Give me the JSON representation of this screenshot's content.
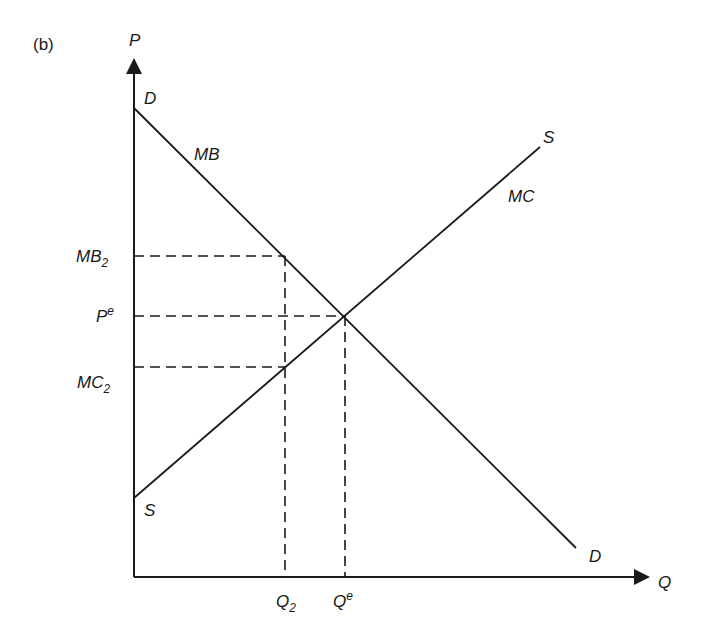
{
  "panel_label": "(b)",
  "axes": {
    "y_label": "P",
    "x_label": "Q"
  },
  "curves": {
    "demand": {
      "end_label_top": "D",
      "end_label_bottom": "D",
      "curve_label": "MB"
    },
    "supply": {
      "end_label_top": "S",
      "end_label_bottom": "S",
      "curve_label": "MC"
    }
  },
  "y_ticks": [
    {
      "base": "MB",
      "sub": "2"
    },
    {
      "base": "P",
      "sup": "e"
    },
    {
      "base": "MC",
      "sub": "2"
    }
  ],
  "x_ticks": [
    {
      "base": "Q",
      "sub": "2"
    },
    {
      "base": "Q",
      "sup": "e"
    }
  ],
  "colors": {
    "line": "#1a1a1a",
    "background": "#ffffff"
  }
}
